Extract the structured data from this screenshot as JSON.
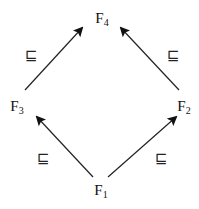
{
  "diagram": {
    "relation_symbol": "⊑",
    "nodes": [
      {
        "id": "F4",
        "base": "F",
        "sub": "4"
      },
      {
        "id": "F3",
        "base": "F",
        "sub": "3"
      },
      {
        "id": "F2",
        "base": "F",
        "sub": "2"
      },
      {
        "id": "F1",
        "base": "F",
        "sub": "1"
      }
    ],
    "edges": [
      {
        "from": "F3",
        "to": "F4",
        "label": "⊑"
      },
      {
        "from": "F2",
        "to": "F4",
        "label": "⊑"
      },
      {
        "from": "F1",
        "to": "F3",
        "label": "⊑"
      },
      {
        "from": "F1",
        "to": "F2",
        "label": "⊑"
      }
    ]
  }
}
